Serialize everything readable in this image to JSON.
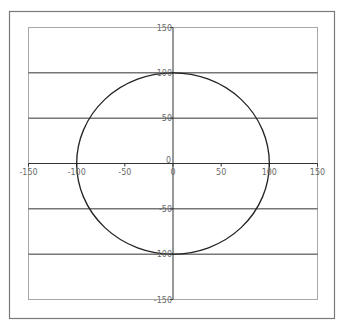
{
  "chart_data": {
    "type": "scatter",
    "title": "",
    "xlabel": "",
    "ylabel": "",
    "xlim": [
      -150,
      150
    ],
    "ylim": [
      -150,
      150
    ],
    "grid": {
      "horizontal": true,
      "vertical": false
    },
    "legend": null,
    "x_ticks": [
      -150,
      -100,
      -50,
      0,
      50,
      100,
      150
    ],
    "x_tick_labels": [
      "-150",
      "-100",
      "-50",
      "0",
      "50",
      "100",
      "150"
    ],
    "y_ticks": [
      150,
      100,
      50,
      0,
      -50,
      -100,
      -150
    ],
    "y_tick_labels": [
      "150",
      "100",
      "50",
      "0",
      "-50",
      "-100",
      "-150"
    ],
    "series": [
      {
        "name": "circle",
        "shape": "circle",
        "center": [
          0,
          0
        ],
        "radius": 100,
        "line_color": "#222222",
        "markers": false,
        "sample_points": [
          {
            "x": 100,
            "y": 0
          },
          {
            "x": 70.7,
            "y": 70.7
          },
          {
            "x": 0,
            "y": 100
          },
          {
            "x": -70.7,
            "y": 70.7
          },
          {
            "x": -100,
            "y": 0
          },
          {
            "x": -70.7,
            "y": -70.7
          },
          {
            "x": 0,
            "y": -100
          },
          {
            "x": 70.7,
            "y": -70.7
          }
        ]
      }
    ]
  },
  "colors": {
    "frame": "#7a7a7a",
    "plot_border": "#a8a8a8",
    "gridline": "#333333",
    "axis": "#333333",
    "tick_label": "#6a6a6a",
    "series": "#222222"
  }
}
